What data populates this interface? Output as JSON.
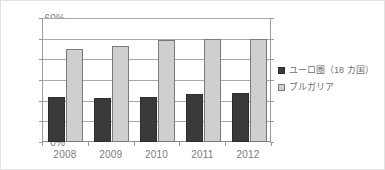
{
  "chart_data": {
    "type": "bar",
    "title": "",
    "subtitle": "",
    "xlabel": "",
    "ylabel": "",
    "categories": [
      "2008",
      "2009",
      "2010",
      "2011",
      "2012"
    ],
    "ylim": [
      0,
      60
    ],
    "ytick_values": [
      0,
      10,
      20,
      30,
      40,
      50,
      60
    ],
    "ytick_labels": [
      "0%",
      "10%",
      "20%",
      "30%",
      "40%",
      "50%",
      "60%"
    ],
    "grid": true,
    "legend_position": "right",
    "series": [
      {
        "name": "ユーロ圏（18 カ国）",
        "color": "#3a3a3a",
        "values": [
          22.0,
          21.5,
          21.7,
          23.0,
          23.6
        ]
      },
      {
        "name": "ブルガリア",
        "color": "#cfcfcf",
        "values": [
          45.0,
          46.6,
          49.5,
          49.6,
          49.8
        ]
      }
    ]
  },
  "legend": {
    "items": [
      {
        "label": "ユーロ圏（18 カ国）",
        "swatch": "dark-square-icon"
      },
      {
        "label": "ブルガリア",
        "swatch": "light-square-icon"
      }
    ]
  }
}
